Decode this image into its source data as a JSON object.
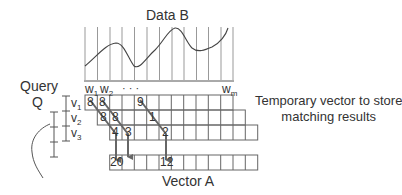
{
  "title": "Data B",
  "query_label": "Query",
  "query_symbol": "Q",
  "window_labels": {
    "w1": "w",
    "w1_sub": "1",
    "w2": "w",
    "w2_sub": "2",
    "dots": "· · ·",
    "wm": "w",
    "wm_sub": "m"
  },
  "segment_labels": [
    {
      "base": "v",
      "sub": "1"
    },
    {
      "base": "v",
      "sub": "2"
    },
    {
      "base": "v",
      "sub": "3"
    }
  ],
  "temp_vector_label_line1": "Temporary vector to store",
  "temp_vector_label_line2": "matching results",
  "vector_a_label": "Vector A",
  "grid": {
    "rows": [
      {
        "segment": "v1",
        "offset_cols": 0,
        "n_cols": 12,
        "values": {
          "0": "8",
          "1": "8",
          "4": "9"
        }
      },
      {
        "segment": "v2",
        "offset_cols": 1,
        "n_cols": 12,
        "values": {
          "0": "8",
          "1": "8",
          "3": "1"
        }
      },
      {
        "segment": "v3",
        "offset_cols": 2,
        "n_cols": 12,
        "values": {
          "0": "4",
          "1": "3",
          "3": "2"
        }
      }
    ],
    "vector_a": {
      "offset_cols": 2,
      "n_cols": 12,
      "values": {
        "0": "20",
        "3": "12"
      }
    }
  },
  "colors": {
    "line": "#555555",
    "arrow": "#666666",
    "grid": "#666666",
    "text": "#222222"
  }
}
